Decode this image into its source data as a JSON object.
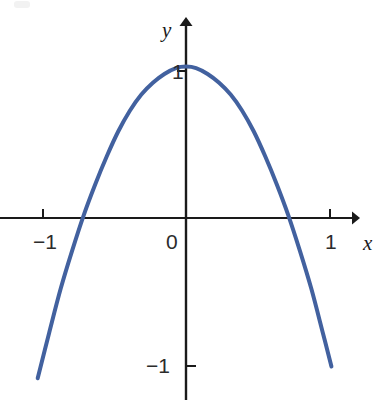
{
  "figure": {
    "background_color": "#ffffff",
    "axis_color": "#1a1a1a",
    "curve_color": "#42619f"
  },
  "labels": {
    "x_axis": "x",
    "y_axis": "y",
    "origin": "0",
    "x_tick_neg1": "−1",
    "x_tick_1": "1",
    "y_tick_1": "1",
    "y_tick_neg1": "−1"
  },
  "chart_data": {
    "type": "line",
    "title": "",
    "xlabel": "x",
    "ylabel": "y",
    "xlim": [
      -1.3,
      1.2
    ],
    "ylim": [
      -1.35,
      1.35
    ],
    "grid": false,
    "legend": null,
    "xticks": [
      -1,
      0,
      1
    ],
    "xticklabels": [
      "−1",
      "0",
      "1"
    ],
    "yticks": [
      -1,
      1
    ],
    "yticklabels": [
      "−1",
      "1"
    ],
    "series": [
      {
        "name": "parabola",
        "color": "#42619f",
        "equation": "y = 1 - 2x^2",
        "vertex": [
          0,
          1.03
        ],
        "roots": [
          -0.72,
          0.72
        ],
        "x": [
          -1.03,
          -0.95,
          -0.87,
          -0.79,
          -0.71,
          -0.63,
          -0.55,
          -0.47,
          -0.39,
          -0.31,
          -0.23,
          -0.15,
          -0.07,
          0.0,
          0.07,
          0.15,
          0.23,
          0.31,
          0.39,
          0.47,
          0.55,
          0.63,
          0.71,
          0.79,
          0.87,
          0.95,
          1.01
        ],
        "y": [
          -1.09,
          -0.78,
          -0.48,
          -0.22,
          0.02,
          0.23,
          0.42,
          0.59,
          0.73,
          0.84,
          0.92,
          0.98,
          1.02,
          1.03,
          1.02,
          0.98,
          0.92,
          0.84,
          0.73,
          0.59,
          0.42,
          0.23,
          0.02,
          -0.22,
          -0.48,
          -0.78,
          -1.01
        ]
      }
    ]
  }
}
